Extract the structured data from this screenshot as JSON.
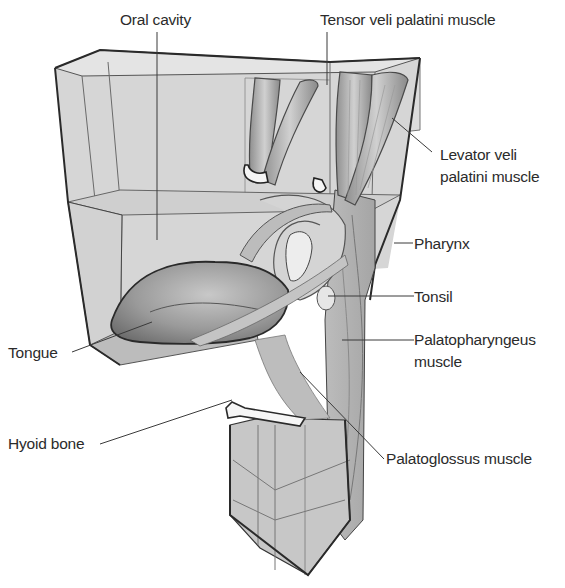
{
  "figure": {
    "type": "anatomical-diagram",
    "colors": {
      "background": "#ffffff",
      "box_fill": "#d9d9d9",
      "box_fill_dark": "#bdbdbd",
      "outline": "#2a2a2a",
      "leader_line": "#3a3a3a",
      "label_text": "#2b2b2b",
      "muscle_fill": "#a8a8a8",
      "bone_fill": "#f4f4f4"
    },
    "labels": {
      "oral_cavity": "Oral cavity",
      "tensor_veli_palatini": "Tensor veli palatini muscle",
      "levator_veli_palatini_line1": "Levator veli",
      "levator_veli_palatini_line2": "palatini muscle",
      "pharynx": "Pharynx",
      "tonsil": "Tonsil",
      "palatopharyngeus_line1": "Palatopharyngeus",
      "palatopharyngeus_line2": "muscle",
      "tongue": "Tongue",
      "hyoid_bone": "Hyoid bone",
      "palatoglossus": "Palatoglossus muscle"
    },
    "structures": [
      "Oral cavity",
      "Tensor veli palatini muscle",
      "Levator veli palatini muscle",
      "Pharynx",
      "Tonsil",
      "Palatopharyngeus muscle",
      "Tongue",
      "Hyoid bone",
      "Palatoglossus muscle"
    ]
  }
}
